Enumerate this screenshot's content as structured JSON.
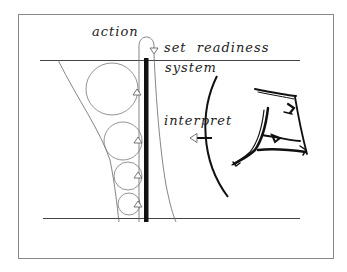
{
  "diagram": {
    "labels": {
      "action": "action",
      "set_readiness": "set  readiness",
      "system": "system",
      "interpret": "interpret"
    },
    "colors": {
      "ink": "#111111",
      "thin_line": "#555555",
      "frame": "#888888",
      "background": "#ffffff"
    },
    "elements": {
      "frame": "rectangular border",
      "top_boundary_line": "horizontal line",
      "bottom_boundary_line": "horizontal line",
      "system_bar": "thick vertical bar",
      "circles": [
        "large loop",
        "medium loop",
        "small loop",
        "smallest loop"
      ],
      "up_arrows": 4,
      "action_loop_arrow": "down arrow into system",
      "interpret_arrow": "left arrow",
      "perception_arc": "curved boundary",
      "sketch_object": "hand-drawn object"
    }
  }
}
